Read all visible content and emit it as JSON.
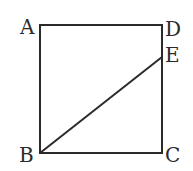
{
  "diagram": {
    "type": "geometry",
    "shape": "square ABCD with segment BE",
    "points": {
      "A": {
        "label": "A",
        "x": 40,
        "y": 25
      },
      "D": {
        "label": "D",
        "x": 162,
        "y": 25
      },
      "E": {
        "label": "E",
        "x": 162,
        "y": 57
      },
      "B": {
        "label": "B",
        "x": 40,
        "y": 153
      },
      "C": {
        "label": "C",
        "x": 162,
        "y": 153
      }
    },
    "segments": [
      "AD",
      "DC",
      "CB",
      "BA",
      "BE"
    ],
    "stroke_color": "#2a2a2a"
  }
}
